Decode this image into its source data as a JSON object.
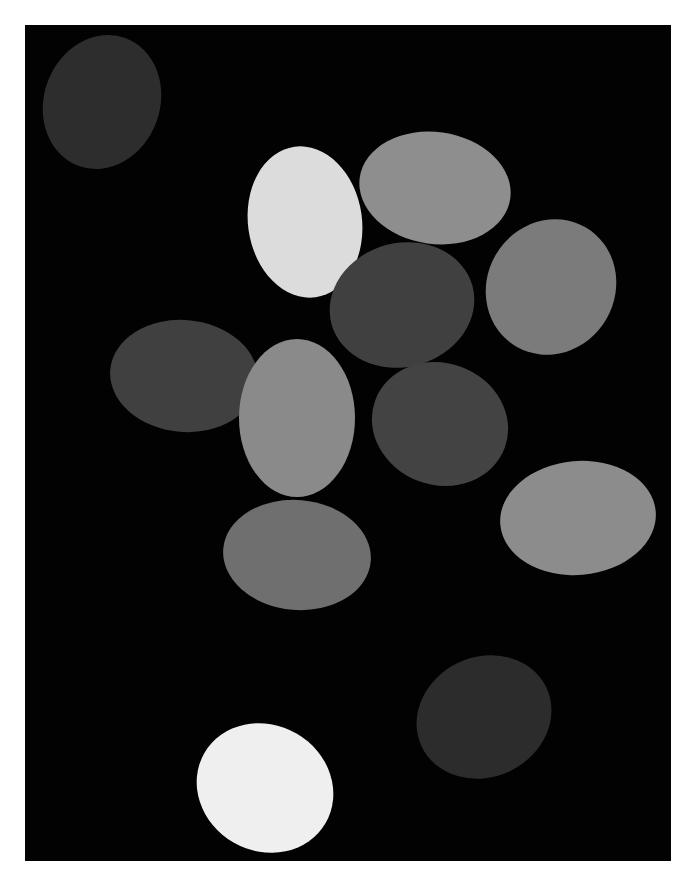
{
  "scene": {
    "background": "#ffffff",
    "panel": {
      "color": "#020202",
      "x": 25,
      "y": 25,
      "w": 646,
      "h": 836
    },
    "eggs": [
      {
        "id": "egg-top-left",
        "cx": 102,
        "cy": 102,
        "w": 116,
        "h": 136,
        "rot": 20,
        "color": "#2d2d2d"
      },
      {
        "id": "egg-white-upper",
        "cx": 305,
        "cy": 222,
        "w": 114,
        "h": 152,
        "rot": -8,
        "color": "#dcdcdc"
      },
      {
        "id": "egg-gray-top",
        "cx": 435,
        "cy": 188,
        "w": 152,
        "h": 112,
        "rot": 8,
        "color": "#8e8e8e"
      },
      {
        "id": "egg-right-upper",
        "cx": 551,
        "cy": 287,
        "w": 128,
        "h": 138,
        "rot": 30,
        "color": "#7b7b7b"
      },
      {
        "id": "egg-center-dark",
        "cx": 402,
        "cy": 305,
        "w": 146,
        "h": 124,
        "rot": -15,
        "color": "#404040"
      },
      {
        "id": "egg-left-mid",
        "cx": 184,
        "cy": 376,
        "w": 148,
        "h": 112,
        "rot": 5,
        "color": "#404040"
      },
      {
        "id": "egg-center-gray",
        "cx": 297,
        "cy": 418,
        "w": 116,
        "h": 158,
        "rot": 0,
        "color": "#8a8a8a"
      },
      {
        "id": "egg-center-dark-2",
        "cx": 440,
        "cy": 424,
        "w": 138,
        "h": 122,
        "rot": 20,
        "color": "#434343"
      },
      {
        "id": "egg-right-lower",
        "cx": 578,
        "cy": 518,
        "w": 156,
        "h": 114,
        "rot": -5,
        "color": "#8c8c8c"
      },
      {
        "id": "egg-lower-mid",
        "cx": 297,
        "cy": 555,
        "w": 148,
        "h": 110,
        "rot": 5,
        "color": "#6f6f6f"
      },
      {
        "id": "egg-bottom-dark",
        "cx": 484,
        "cy": 717,
        "w": 138,
        "h": 120,
        "rot": -25,
        "color": "#2c2c2c"
      },
      {
        "id": "egg-bottom-white",
        "cx": 265,
        "cy": 788,
        "w": 140,
        "h": 126,
        "rot": 30,
        "color": "#efefef"
      }
    ]
  }
}
